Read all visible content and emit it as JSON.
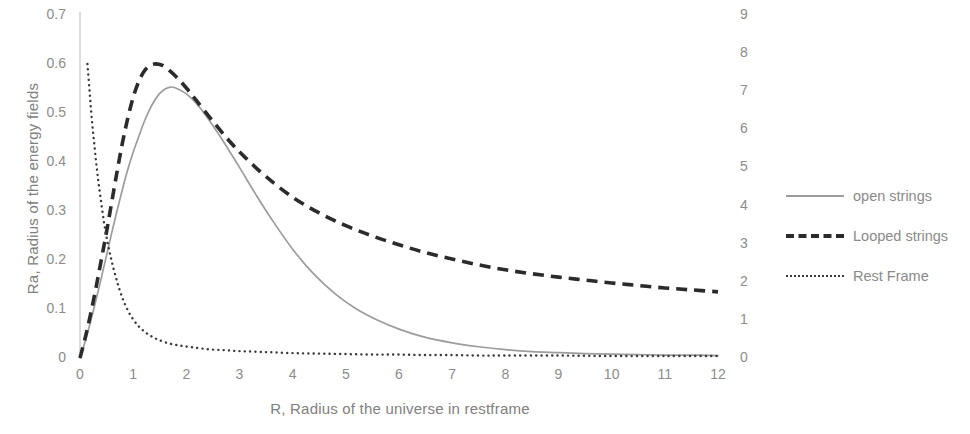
{
  "chart_data": {
    "type": "line",
    "title": "",
    "xlabel": "R, Radius of the universe in restframe",
    "ylabel": "Ra, Radius of the energy fields",
    "ylabel_right": "",
    "xlim": [
      0,
      12
    ],
    "ylim": [
      0,
      0.7
    ],
    "ylim_right": [
      0,
      9
    ],
    "grid": false,
    "legend_position": "right",
    "xticks": [
      "0",
      "1",
      "2",
      "3",
      "4",
      "5",
      "6",
      "7",
      "8",
      "9",
      "10",
      "11",
      "12"
    ],
    "yticks_left": [
      "0",
      "0.1",
      "0.2",
      "0.3",
      "0.4",
      "0.5",
      "0.6",
      "0.7"
    ],
    "yticks_right": [
      "0",
      "1",
      "2",
      "3",
      "4",
      "5",
      "6",
      "7",
      "8",
      "9"
    ],
    "series": [
      {
        "name": "open strings",
        "style": "solid",
        "color": "#9c9c9c",
        "axis": "left",
        "x": [
          0,
          0.1,
          0.2,
          0.3,
          0.4,
          0.5,
          0.6,
          0.7,
          0.8,
          0.9,
          1.0,
          1.1,
          1.2,
          1.3,
          1.4,
          1.5,
          1.6,
          1.7,
          1.8,
          2.0,
          2.2,
          2.4,
          2.6,
          2.8,
          3.0,
          3.3,
          3.6,
          4.0,
          4.4,
          4.8,
          5.2,
          5.6,
          6.0,
          6.5,
          7.0,
          7.5,
          8.0,
          8.5,
          9.0,
          9.5,
          10.0,
          10.5,
          11.0,
          11.5,
          12.0
        ],
        "y": [
          0,
          0.035,
          0.075,
          0.118,
          0.163,
          0.21,
          0.257,
          0.302,
          0.345,
          0.385,
          0.42,
          0.45,
          0.48,
          0.505,
          0.525,
          0.54,
          0.549,
          0.553,
          0.551,
          0.539,
          0.518,
          0.49,
          0.458,
          0.424,
          0.389,
          0.335,
          0.284,
          0.222,
          0.171,
          0.131,
          0.1,
          0.077,
          0.059,
          0.042,
          0.031,
          0.023,
          0.017,
          0.013,
          0.011,
          0.009,
          0.008,
          0.007,
          0.006,
          0.006,
          0.005
        ]
      },
      {
        "name": "Looped strings",
        "style": "dashed",
        "color": "#2b2b2b",
        "axis": "left",
        "x": [
          0,
          0.1,
          0.2,
          0.3,
          0.4,
          0.5,
          0.6,
          0.7,
          0.8,
          0.9,
          1.0,
          1.1,
          1.2,
          1.3,
          1.4,
          1.5,
          1.6,
          1.8,
          2.0,
          2.2,
          2.5,
          2.8,
          3.1,
          3.5,
          4.0,
          4.5,
          5.0,
          5.5,
          6.0,
          6.5,
          7.0,
          7.5,
          8.0,
          8.5,
          9.0,
          9.5,
          10.0,
          10.5,
          11.0,
          11.5,
          12.0
        ],
        "y": [
          0,
          0.042,
          0.09,
          0.143,
          0.2,
          0.258,
          0.32,
          0.382,
          0.44,
          0.49,
          0.532,
          0.563,
          0.584,
          0.596,
          0.6,
          0.599,
          0.594,
          0.575,
          0.551,
          0.524,
          0.483,
          0.444,
          0.41,
          0.37,
          0.328,
          0.296,
          0.27,
          0.249,
          0.231,
          0.215,
          0.202,
          0.19,
          0.18,
          0.172,
          0.165,
          0.159,
          0.153,
          0.148,
          0.143,
          0.139,
          0.135
        ]
      },
      {
        "name": "Rest Frame",
        "style": "dotted",
        "color": "#3a3a3a",
        "axis": "left",
        "x": [
          0.14,
          0.18,
          0.22,
          0.27,
          0.32,
          0.38,
          0.45,
          0.52,
          0.6,
          0.7,
          0.8,
          0.9,
          1.0,
          1.1,
          1.2,
          1.3,
          1.4,
          1.5,
          1.7,
          1.9,
          2.1,
          2.4,
          2.7,
          3.0,
          3.5,
          4.0,
          4.5,
          5.0,
          5.5,
          6.0,
          6.5,
          7.0,
          7.5,
          8.0,
          9.0,
          10.0,
          11.0,
          12.0
        ],
        "y": [
          0.6,
          0.545,
          0.49,
          0.435,
          0.383,
          0.332,
          0.278,
          0.235,
          0.196,
          0.155,
          0.122,
          0.097,
          0.079,
          0.065,
          0.055,
          0.047,
          0.041,
          0.036,
          0.029,
          0.025,
          0.022,
          0.018,
          0.016,
          0.014,
          0.012,
          0.01,
          0.009,
          0.008,
          0.007,
          0.007,
          0.006,
          0.006,
          0.005,
          0.005,
          0.005,
          0.004,
          0.004,
          0.004
        ]
      }
    ]
  },
  "legend": {
    "items": [
      {
        "label": "open strings"
      },
      {
        "label": "Looped strings"
      },
      {
        "label": "Rest Frame"
      }
    ]
  }
}
